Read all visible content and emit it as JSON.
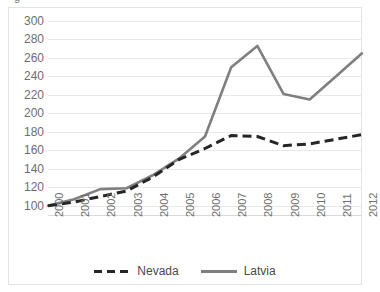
{
  "chart_data": {
    "type": "line",
    "title": "",
    "xlabel": "",
    "ylabel": "",
    "x": [
      "2000",
      "2001",
      "2002",
      "2003",
      "2004",
      "2005",
      "2006",
      "2007",
      "2008",
      "2009",
      "2010",
      "2011",
      "2012"
    ],
    "categories": [
      "2000",
      "2001",
      "2002",
      "2003",
      "2004",
      "2005",
      "2006",
      "2007",
      "2008",
      "2009",
      "2010",
      "2011",
      "2012"
    ],
    "ylim": [
      90,
      300
    ],
    "ytick_values": [
      100,
      120,
      140,
      160,
      180,
      200,
      220,
      240,
      260,
      280,
      300
    ],
    "ytick_labels": [
      "100",
      "120",
      "140",
      "160",
      "180",
      "200",
      "220",
      "240",
      "260",
      "280",
      "300"
    ],
    "grid": true,
    "legend_position": "bottom",
    "series": [
      {
        "name": "Nevada",
        "style": "dashed",
        "color": "#262626",
        "values": [
          100,
          104,
          110,
          116,
          131,
          150,
          162,
          176,
          175,
          165,
          167,
          172,
          177
        ]
      },
      {
        "name": "Latvia",
        "style": "solid",
        "color": "#7f7f7f",
        "values": [
          100,
          107,
          118,
          119,
          133,
          151,
          175,
          250,
          273,
          221,
          215,
          240,
          265
        ]
      }
    ]
  },
  "title_fragment": "g",
  "legend": {
    "items": [
      {
        "label": "Nevada",
        "swatch": "dashed-line-swatch"
      },
      {
        "label": "Latvia",
        "swatch": "solid-line-swatch"
      }
    ]
  }
}
